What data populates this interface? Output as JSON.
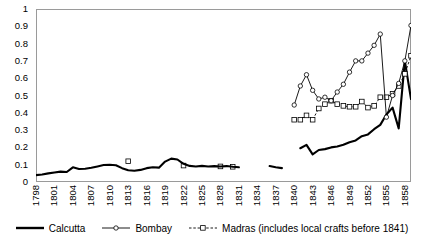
{
  "chart_data": {
    "type": "line",
    "title": "",
    "xlabel": "",
    "ylabel": "",
    "ylim": [
      0,
      1
    ],
    "ytick_values": [
      0,
      0.1,
      0.2,
      0.3,
      0.4,
      0.5,
      0.6,
      0.7,
      0.8,
      0.9,
      1
    ],
    "ytick_labels": [
      "0",
      "0.1",
      "0.2",
      "0.3",
      "0.4",
      "0.5",
      "0.6",
      "0.7",
      "0.8",
      "0.9",
      "1"
    ],
    "grid": false,
    "legend_position": "bottom",
    "xlim": [
      1798,
      1859
    ],
    "xtick_labels": [
      "1798",
      "1801",
      "1804",
      "1807",
      "1810",
      "1813",
      "1816",
      "1819",
      "1822",
      "1825",
      "1828",
      "1831",
      "1834",
      "1837",
      "1840",
      "1843",
      "1846",
      "1849",
      "1852",
      "1855",
      "1858"
    ],
    "x_all_years": [
      1798,
      1799,
      1800,
      1801,
      1802,
      1803,
      1804,
      1805,
      1806,
      1807,
      1808,
      1809,
      1810,
      1811,
      1812,
      1813,
      1814,
      1815,
      1816,
      1817,
      1818,
      1819,
      1820,
      1821,
      1822,
      1823,
      1824,
      1825,
      1826,
      1827,
      1828,
      1829,
      1830,
      1831,
      1832,
      1833,
      1834,
      1835,
      1836,
      1837,
      1838,
      1839,
      1840,
      1841,
      1842,
      1843,
      1844,
      1845,
      1846,
      1847,
      1848,
      1849,
      1850,
      1851,
      1852,
      1853,
      1854,
      1855,
      1856,
      1857,
      1858,
      1859
    ],
    "series": [
      {
        "name": "Calcutta",
        "style": "thick-solid-black-no-marker",
        "color": "#000000",
        "points": [
          {
            "x": 1798,
            "y": 0.04
          },
          {
            "x": 1799,
            "y": 0.043
          },
          {
            "x": 1800,
            "y": 0.05
          },
          {
            "x": 1801,
            "y": 0.055
          },
          {
            "x": 1802,
            "y": 0.06
          },
          {
            "x": 1803,
            "y": 0.058
          },
          {
            "x": 1804,
            "y": 0.085
          },
          {
            "x": 1805,
            "y": 0.075
          },
          {
            "x": 1806,
            "y": 0.077
          },
          {
            "x": 1807,
            "y": 0.082
          },
          {
            "x": 1808,
            "y": 0.09
          },
          {
            "x": 1809,
            "y": 0.098
          },
          {
            "x": 1810,
            "y": 0.1
          },
          {
            "x": 1811,
            "y": 0.097
          },
          {
            "x": 1812,
            "y": 0.08
          },
          {
            "x": 1813,
            "y": 0.068
          },
          {
            "x": 1814,
            "y": 0.065
          },
          {
            "x": 1815,
            "y": 0.07
          },
          {
            "x": 1816,
            "y": 0.08
          },
          {
            "x": 1817,
            "y": 0.085
          },
          {
            "x": 1818,
            "y": 0.083
          },
          {
            "x": 1819,
            "y": 0.118
          },
          {
            "x": 1820,
            "y": 0.135
          },
          {
            "x": 1821,
            "y": 0.13
          },
          {
            "x": 1822,
            "y": 0.105
          },
          {
            "x": 1823,
            "y": 0.093
          },
          {
            "x": 1824,
            "y": 0.09
          },
          {
            "x": 1825,
            "y": 0.093
          },
          {
            "x": 1826,
            "y": 0.09
          },
          {
            "x": 1827,
            "y": 0.092
          },
          {
            "x": 1828,
            "y": 0.09
          },
          {
            "x": 1829,
            "y": 0.092
          },
          {
            "x": 1830,
            "y": 0.088
          },
          {
            "x": 1831,
            "y": 0.085
          }
        ],
        "points_segment2": [
          {
            "x": 1836,
            "y": 0.092
          },
          {
            "x": 1837,
            "y": 0.085
          },
          {
            "x": 1838,
            "y": 0.08
          }
        ],
        "points_segment3": [
          {
            "x": 1841,
            "y": 0.195
          },
          {
            "x": 1842,
            "y": 0.215
          },
          {
            "x": 1843,
            "y": 0.16
          },
          {
            "x": 1844,
            "y": 0.185
          },
          {
            "x": 1845,
            "y": 0.19
          },
          {
            "x": 1846,
            "y": 0.2
          },
          {
            "x": 1847,
            "y": 0.205
          },
          {
            "x": 1848,
            "y": 0.215
          },
          {
            "x": 1849,
            "y": 0.23
          },
          {
            "x": 1850,
            "y": 0.24
          },
          {
            "x": 1851,
            "y": 0.265
          },
          {
            "x": 1852,
            "y": 0.275
          },
          {
            "x": 1853,
            "y": 0.305
          },
          {
            "x": 1854,
            "y": 0.33
          },
          {
            "x": 1855,
            "y": 0.39
          },
          {
            "x": 1856,
            "y": 0.43
          },
          {
            "x": 1857,
            "y": 0.31
          },
          {
            "x": 1858,
            "y": 0.7
          },
          {
            "x": 1859,
            "y": 0.48
          }
        ]
      },
      {
        "name": "Bombay",
        "style": "thin-solid-black-circle-marker",
        "color": "#000000",
        "points": [
          {
            "x": 1840,
            "y": 0.445
          },
          {
            "x": 1841,
            "y": 0.555
          },
          {
            "x": 1842,
            "y": 0.62
          },
          {
            "x": 1843,
            "y": 0.53
          },
          {
            "x": 1844,
            "y": 0.48
          },
          {
            "x": 1845,
            "y": 0.49
          },
          {
            "x": 1846,
            "y": 0.47
          },
          {
            "x": 1847,
            "y": 0.52
          },
          {
            "x": 1848,
            "y": 0.565
          },
          {
            "x": 1849,
            "y": 0.635
          },
          {
            "x": 1850,
            "y": 0.7
          },
          {
            "x": 1851,
            "y": 0.7
          },
          {
            "x": 1852,
            "y": 0.745
          },
          {
            "x": 1853,
            "y": 0.79
          },
          {
            "x": 1854,
            "y": 0.855
          },
          {
            "x": 1855,
            "y": 0.375
          },
          {
            "x": 1856,
            "y": 0.5
          },
          {
            "x": 1857,
            "y": 0.57
          },
          {
            "x": 1858,
            "y": 0.7
          },
          {
            "x": 1859,
            "y": 0.905
          }
        ]
      },
      {
        "name": "Madras (includes local crafts before 1841)",
        "style": "dashed-black-square-marker",
        "color": "#000000",
        "points_early": [
          {
            "x": 1813,
            "y": 0.12
          },
          {
            "x": 1822,
            "y": 0.095
          },
          {
            "x": 1828,
            "y": 0.09
          },
          {
            "x": 1830,
            "y": 0.088
          }
        ],
        "points": [
          {
            "x": 1840,
            "y": 0.36
          },
          {
            "x": 1841,
            "y": 0.36
          },
          {
            "x": 1842,
            "y": 0.385
          },
          {
            "x": 1843,
            "y": 0.36
          },
          {
            "x": 1844,
            "y": 0.425
          },
          {
            "x": 1845,
            "y": 0.45
          },
          {
            "x": 1846,
            "y": 0.47
          },
          {
            "x": 1847,
            "y": 0.45
          },
          {
            "x": 1848,
            "y": 0.44
          },
          {
            "x": 1849,
            "y": 0.435
          },
          {
            "x": 1850,
            "y": 0.435
          },
          {
            "x": 1851,
            "y": 0.465
          },
          {
            "x": 1852,
            "y": 0.43
          },
          {
            "x": 1853,
            "y": 0.44
          },
          {
            "x": 1854,
            "y": 0.49
          },
          {
            "x": 1855,
            "y": 0.49
          },
          {
            "x": 1856,
            "y": 0.51
          },
          {
            "x": 1857,
            "y": 0.555
          },
          {
            "x": 1858,
            "y": 0.625
          },
          {
            "x": 1859,
            "y": 0.73
          }
        ]
      }
    ],
    "legend": [
      {
        "label": "Calcutta",
        "marker": "none",
        "line": "thick-solid"
      },
      {
        "label": "Bombay",
        "marker": "circle",
        "line": "thin-solid"
      },
      {
        "label": "Madras (includes local crafts before 1841)",
        "marker": "square",
        "line": "dashed"
      }
    ]
  }
}
